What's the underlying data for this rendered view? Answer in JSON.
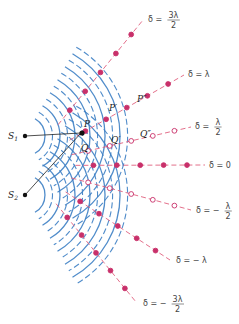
{
  "figure": {
    "sources": [
      {
        "id": "S1",
        "label": "S",
        "sub": "1"
      },
      {
        "id": "S2",
        "label": "S",
        "sub": "2"
      }
    ],
    "points": [
      {
        "label": "P",
        "prime": ""
      },
      {
        "label": "P",
        "prime": "′"
      },
      {
        "label": "P",
        "prime": "″"
      },
      {
        "label": "Q",
        "prime": ""
      },
      {
        "label": "Q",
        "prime": "′"
      },
      {
        "label": "Q",
        "prime": "″"
      }
    ],
    "delta_lines": [
      {
        "id": "d_p3",
        "prefix": "δ =",
        "value": "3λ",
        "den": "2",
        "sign": "",
        "kind": "fraction",
        "marker": "filled"
      },
      {
        "id": "d_p2",
        "prefix": "δ =",
        "value": "λ",
        "den": "",
        "sign": "",
        "kind": "simple",
        "marker": "filled"
      },
      {
        "id": "d_p1",
        "prefix": "δ =",
        "value": "λ",
        "den": "2",
        "sign": "",
        "kind": "fraction",
        "marker": "open"
      },
      {
        "id": "d_0",
        "prefix": "δ =",
        "value": "0",
        "den": "",
        "sign": "",
        "kind": "simple",
        "marker": "filled"
      },
      {
        "id": "d_m1",
        "prefix": "δ =",
        "value": "λ",
        "den": "2",
        "sign": "−",
        "kind": "fraction",
        "marker": "open"
      },
      {
        "id": "d_m2",
        "prefix": "δ =",
        "value": "λ",
        "den": "",
        "sign": "−",
        "kind": "simple",
        "marker": "filled"
      },
      {
        "id": "d_m3",
        "prefix": "δ =",
        "value": "3λ",
        "den": "2",
        "sign": "−",
        "kind": "fraction",
        "marker": "filled"
      }
    ],
    "colors": {
      "crest": "#3d7fc4",
      "trough": "#3d7fc4",
      "nodal_line": "#e0607e",
      "marker_fill": "#c8306a",
      "source": "#111111"
    }
  }
}
